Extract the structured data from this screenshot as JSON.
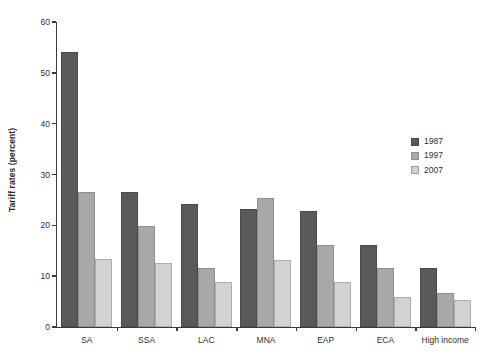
{
  "chart_data": {
    "type": "bar",
    "title": "",
    "subtitle": "",
    "xlabel": "",
    "ylabel": "Tariff rates (percent)",
    "ylim": [
      0,
      60
    ],
    "yticks": [
      0,
      10,
      20,
      30,
      40,
      50,
      60
    ],
    "ytick_labels": [
      "0",
      "10",
      "20",
      "30",
      "40",
      "50",
      "60"
    ],
    "grid": false,
    "legend_position": "right",
    "categories": [
      "SA",
      "SSA",
      "LAC",
      "MNA",
      "EAP",
      "ECA",
      "High income"
    ],
    "series": [
      {
        "name": "1987",
        "color": "#595959",
        "values": [
          54.1,
          26.5,
          24.2,
          23.2,
          22.8,
          16.1,
          11.6
        ]
      },
      {
        "name": "1997",
        "color": "#a8a8a8",
        "values": [
          26.5,
          19.8,
          11.6,
          25.4,
          16.1,
          11.6,
          6.7
        ]
      },
      {
        "name": "2007",
        "color": "#d2d2d2",
        "values": [
          13.3,
          12.5,
          8.9,
          13.2,
          8.9,
          5.9,
          5.4
        ]
      }
    ]
  },
  "legend": {
    "items": [
      {
        "label": "1987",
        "color": "#595959"
      },
      {
        "label": "1997",
        "color": "#a8a8a8"
      },
      {
        "label": "2007",
        "color": "#d2d2d2"
      }
    ]
  },
  "axes": {
    "y_title": "Tariff rates (percent)"
  }
}
